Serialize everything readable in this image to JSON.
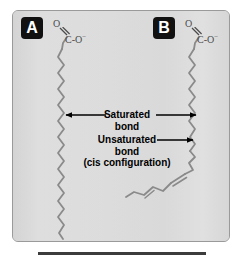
{
  "figure": {
    "name": "fatty-acid-saturation-comparison",
    "panel_background": "#dcdcdc",
    "panel_border_color": "#9a9a9a",
    "chain_color": "#8a8a8a",
    "annotation_color": "#000000",
    "badge_background": "#111111",
    "badge_text_color": "#ffffff",
    "rule_color": "#3c3c3c"
  },
  "panels": [
    {
      "id": "a",
      "badge_label": "A",
      "description": "saturated fatty acid, straight zigzag chain"
    },
    {
      "id": "b",
      "badge_label": "B",
      "description": "unsaturated fatty acid, chain kinked at cis double bond"
    }
  ],
  "headgroups": [
    {
      "id": "a",
      "oxygen_double_bonded": "O",
      "carbon": "C",
      "dash": "-",
      "oxygen_anion": "O",
      "charge": "−"
    },
    {
      "id": "b",
      "oxygen_double_bonded": "O",
      "carbon": "C",
      "dash": "-",
      "oxygen_anion": "O",
      "charge": "−"
    }
  ],
  "annotations": {
    "saturated": {
      "line1": "Saturated",
      "line2": "bond",
      "arrow_left": "left-arrow",
      "arrow_right": "right-arrow"
    },
    "unsaturated": {
      "line1": "Unsaturated",
      "line2": "bond",
      "line3": "(cis configuration)",
      "arrow_right": "right-arrow"
    }
  }
}
